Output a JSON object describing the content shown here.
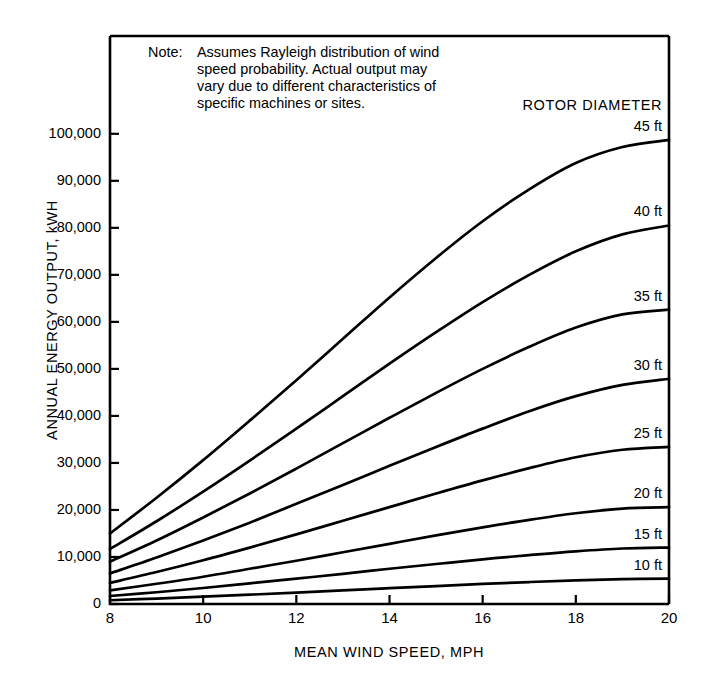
{
  "note": {
    "label": "Note:",
    "lines": [
      "Assumes Rayleigh distribution of wind",
      "speed probability.  Actual output may",
      "vary due to different characteristics of",
      "specific machines or sites."
    ]
  },
  "legend": {
    "title": "ROTOR DIAMETER"
  },
  "chart_data": {
    "type": "line",
    "title": "",
    "xlabel": "MEAN WIND SPEED, MPH",
    "ylabel": "ANNUAL ENERGY OUTPUT, kWH",
    "xlim": [
      8,
      20
    ],
    "ylim": [
      0,
      120800
    ],
    "grid": false,
    "legend_position": "right-inline",
    "xticks": [
      8,
      10,
      12,
      14,
      16,
      18,
      20
    ],
    "xtick_labels": [
      "8",
      "10",
      "12",
      "14",
      "16",
      "18",
      "20"
    ],
    "yticks": [
      0,
      10000,
      20000,
      30000,
      40000,
      50000,
      60000,
      70000,
      80000,
      90000,
      100000
    ],
    "ytick_labels": [
      "0",
      "10,000",
      "20,000",
      "30,000",
      "40,000",
      "50,000",
      "60,000",
      "70,000",
      "80,000",
      "90,000",
      "100,000"
    ],
    "x": [
      8,
      9,
      10,
      11,
      12,
      13,
      14,
      15,
      16,
      17,
      18,
      19,
      20
    ],
    "series": [
      {
        "name": "45 ft",
        "label": "45 ft",
        "values": [
          15000,
          22600,
          30600,
          39000,
          47600,
          56400,
          65200,
          73600,
          81400,
          88200,
          93800,
          97200,
          98700
        ]
      },
      {
        "name": "40 ft",
        "label": "40 ft",
        "values": [
          11700,
          17600,
          23900,
          30500,
          37300,
          44200,
          51100,
          57800,
          64200,
          70000,
          75000,
          78600,
          80500
        ]
      },
      {
        "name": "35 ft",
        "label": "35 ft",
        "values": [
          9000,
          13500,
          18400,
          23500,
          28800,
          34200,
          39600,
          44900,
          50000,
          54700,
          58800,
          61600,
          62600
        ]
      },
      {
        "name": "30 ft",
        "label": "30 ft",
        "values": [
          6500,
          9900,
          13500,
          17300,
          21300,
          25300,
          29400,
          33400,
          37300,
          41000,
          44200,
          46600,
          47900
        ]
      },
      {
        "name": "25 ft",
        "label": "25 ft",
        "values": [
          4500,
          6800,
          9300,
          12000,
          14800,
          17700,
          20600,
          23500,
          26300,
          28900,
          31200,
          32800,
          33400
        ]
      },
      {
        "name": "20 ft",
        "label": "20 ft",
        "values": [
          2900,
          4300,
          5800,
          7500,
          9200,
          11000,
          12800,
          14600,
          16300,
          17900,
          19300,
          20300,
          20600
        ]
      },
      {
        "name": "15 ft",
        "label": "15 ft",
        "values": [
          1700,
          2500,
          3400,
          4400,
          5400,
          6400,
          7500,
          8500,
          9500,
          10400,
          11200,
          11800,
          12000
        ]
      },
      {
        "name": "10 ft",
        "label": "10 ft",
        "values": [
          800,
          1150,
          1550,
          1980,
          2430,
          2890,
          3360,
          3820,
          4260,
          4670,
          5030,
          5290,
          5400
        ]
      }
    ]
  }
}
